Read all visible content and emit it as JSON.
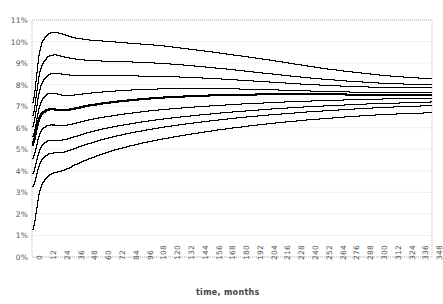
{
  "chart_data": {
    "type": "line",
    "title": "",
    "subtitle": "",
    "xlabel": "time, months",
    "ylabel": "",
    "grid": true,
    "legend": "none",
    "xlim": [
      0,
      348
    ],
    "ylim": [
      0,
      11
    ],
    "x_tick_step": 12,
    "y_tick_step": 1,
    "x": [
      0,
      6,
      12,
      18,
      24,
      30,
      36,
      42,
      48,
      60,
      72,
      84,
      96,
      108,
      120,
      132,
      144,
      156,
      168,
      180,
      192,
      204,
      216,
      228,
      240,
      252,
      264,
      276,
      288,
      300,
      312,
      324,
      336,
      348
    ],
    "xticklabels": [
      "0",
      "12",
      "24",
      "36",
      "48",
      "60",
      "72",
      "84",
      "96",
      "108",
      "120",
      "132",
      "144",
      "156",
      "168",
      "180",
      "192",
      "204",
      "216",
      "228",
      "240",
      "252",
      "264",
      "276",
      "288",
      "300",
      "312",
      "324",
      "336",
      "348"
    ],
    "yticklabels": [
      "0%",
      "1%",
      "2%",
      "3%",
      "4%",
      "5%",
      "6%",
      "7%",
      "8%",
      "9%",
      "10%",
      "11%"
    ],
    "series": [
      {
        "name": "percentile-99",
        "emphasis": false,
        "values": [
          7.2,
          9.6,
          10.3,
          10.45,
          10.4,
          10.3,
          10.2,
          10.15,
          10.1,
          10.05,
          10.0,
          9.95,
          9.9,
          9.85,
          9.78,
          9.7,
          9.62,
          9.54,
          9.45,
          9.36,
          9.27,
          9.18,
          9.08,
          8.98,
          8.88,
          8.78,
          8.7,
          8.62,
          8.55,
          8.48,
          8.42,
          8.37,
          8.33,
          8.3
        ]
      },
      {
        "name": "percentile-95",
        "emphasis": false,
        "values": [
          6.6,
          8.6,
          9.25,
          9.4,
          9.35,
          9.28,
          9.22,
          9.18,
          9.15,
          9.12,
          9.1,
          9.08,
          9.05,
          9.02,
          8.98,
          8.93,
          8.87,
          8.81,
          8.75,
          8.68,
          8.61,
          8.54,
          8.47,
          8.4,
          8.34,
          8.28,
          8.23,
          8.18,
          8.14,
          8.1,
          8.07,
          8.05,
          8.03,
          8.02
        ]
      },
      {
        "name": "percentile-90",
        "emphasis": false,
        "values": [
          6.1,
          7.8,
          8.4,
          8.55,
          8.52,
          8.48,
          8.45,
          8.44,
          8.43,
          8.43,
          8.43,
          8.43,
          8.42,
          8.41,
          8.39,
          8.37,
          8.34,
          8.31,
          8.27,
          8.23,
          8.19,
          8.15,
          8.11,
          8.07,
          8.03,
          8.0,
          7.97,
          7.94,
          7.92,
          7.9,
          7.89,
          7.88,
          7.87,
          7.87
        ]
      },
      {
        "name": "percentile-75",
        "emphasis": false,
        "values": [
          5.6,
          7.05,
          7.55,
          7.62,
          7.55,
          7.52,
          7.54,
          7.58,
          7.62,
          7.68,
          7.73,
          7.77,
          7.8,
          7.82,
          7.83,
          7.84,
          7.84,
          7.84,
          7.83,
          7.82,
          7.8,
          7.79,
          7.77,
          7.75,
          7.73,
          7.71,
          7.7,
          7.68,
          7.67,
          7.66,
          7.65,
          7.65,
          7.65,
          7.65
        ]
      },
      {
        "name": "median",
        "emphasis": true,
        "values": [
          5.2,
          6.45,
          6.8,
          6.85,
          6.82,
          6.83,
          6.88,
          6.95,
          7.02,
          7.12,
          7.2,
          7.27,
          7.33,
          7.38,
          7.42,
          7.45,
          7.48,
          7.5,
          7.52,
          7.53,
          7.54,
          7.55,
          7.55,
          7.55,
          7.55,
          7.55,
          7.55,
          7.54,
          7.54,
          7.53,
          7.53,
          7.52,
          7.52,
          7.52
        ]
      },
      {
        "name": "percentile-25",
        "emphasis": false,
        "values": [
          4.6,
          5.75,
          6.1,
          6.15,
          6.12,
          6.15,
          6.22,
          6.3,
          6.38,
          6.5,
          6.6,
          6.69,
          6.77,
          6.84,
          6.9,
          6.95,
          7.0,
          7.04,
          7.08,
          7.12,
          7.15,
          7.18,
          7.21,
          7.24,
          7.26,
          7.28,
          7.3,
          7.32,
          7.34,
          7.35,
          7.37,
          7.38,
          7.39,
          7.4
        ]
      },
      {
        "name": "percentile-10",
        "emphasis": false,
        "values": [
          3.9,
          5.0,
          5.38,
          5.45,
          5.44,
          5.5,
          5.6,
          5.7,
          5.8,
          5.96,
          6.09,
          6.2,
          6.3,
          6.39,
          6.47,
          6.54,
          6.61,
          6.67,
          6.73,
          6.78,
          6.83,
          6.88,
          6.92,
          6.96,
          7.0,
          7.03,
          7.06,
          7.09,
          7.12,
          7.14,
          7.16,
          7.18,
          7.2,
          7.22
        ]
      },
      {
        "name": "percentile-5",
        "emphasis": false,
        "values": [
          3.3,
          4.35,
          4.75,
          4.85,
          4.86,
          4.94,
          5.05,
          5.17,
          5.28,
          5.47,
          5.63,
          5.77,
          5.89,
          6.0,
          6.1,
          6.19,
          6.27,
          6.35,
          6.42,
          6.49,
          6.55,
          6.61,
          6.66,
          6.71,
          6.76,
          6.8,
          6.84,
          6.88,
          6.92,
          6.95,
          6.98,
          7.01,
          7.03,
          7.05
        ]
      },
      {
        "name": "percentile-1",
        "emphasis": false,
        "values": [
          1.3,
          3.1,
          3.7,
          3.92,
          4.0,
          4.12,
          4.28,
          4.43,
          4.57,
          4.8,
          5.0,
          5.17,
          5.32,
          5.45,
          5.57,
          5.68,
          5.78,
          5.88,
          5.97,
          6.05,
          6.13,
          6.2,
          6.27,
          6.33,
          6.39,
          6.44,
          6.49,
          6.54,
          6.58,
          6.62,
          6.65,
          6.68,
          6.7,
          6.72
        ]
      }
    ],
    "colors": {
      "line": "#000000",
      "grid": "#f0f0f0",
      "frame": "#b8b8b8",
      "tick_text": "#555555",
      "axis_title": "#444444",
      "background": "#ffffff"
    }
  }
}
